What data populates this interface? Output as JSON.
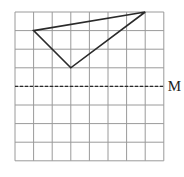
{
  "grid": {
    "cols": 8,
    "rows": 8,
    "origin_x": 15,
    "origin_y": 12,
    "cell": 18.6,
    "line_color": "#9a9a9a"
  },
  "triangle": {
    "vertices": [
      [
        7,
        0
      ],
      [
        1,
        1
      ],
      [
        3,
        3
      ]
    ],
    "stroke": "#2a2a2a"
  },
  "mirror_line": {
    "row": 4,
    "label": "M",
    "stroke": "#2a2a2a"
  }
}
